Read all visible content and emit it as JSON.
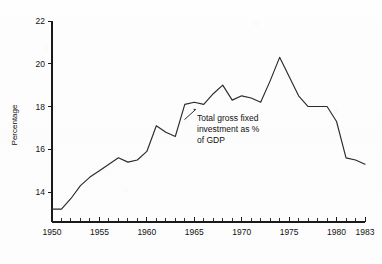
{
  "chart_data": {
    "type": "line",
    "title": "",
    "xlabel": "",
    "ylabel": "Percentage",
    "xlim": [
      1950,
      1983
    ],
    "ylim": [
      12.6,
      22
    ],
    "grid": false,
    "legend_position": "none",
    "x_ticks_major": [
      1950,
      1955,
      1960,
      1965,
      1970,
      1975,
      1980,
      1983
    ],
    "x_tick_labels": [
      "1950",
      "1955",
      "1960",
      "1965",
      "1970",
      "1975",
      "1980",
      "1983"
    ],
    "x_ticks_minor": [
      1951,
      1952,
      1953,
      1954,
      1956,
      1957,
      1958,
      1959,
      1961,
      1962,
      1963,
      1964,
      1966,
      1967,
      1968,
      1969,
      1971,
      1972,
      1973,
      1974,
      1976,
      1977,
      1978,
      1979,
      1981,
      1982
    ],
    "y_ticks": [
      14,
      16,
      18,
      20,
      22
    ],
    "y_tick_labels": [
      "14",
      "16",
      "18",
      "20",
      "22"
    ],
    "series": [
      {
        "name": "Total gross fixed investment as % of GDP",
        "x": [
          1950,
          1951,
          1952,
          1953,
          1954,
          1955,
          1956,
          1957,
          1958,
          1959,
          1960,
          1961,
          1962,
          1963,
          1964,
          1965,
          1966,
          1967,
          1968,
          1969,
          1970,
          1971,
          1972,
          1973,
          1974,
          1975,
          1976,
          1977,
          1978,
          1979,
          1980,
          1981,
          1982,
          1983
        ],
        "values": [
          13.2,
          13.2,
          13.7,
          14.3,
          14.7,
          15.0,
          15.3,
          15.6,
          15.4,
          15.5,
          15.9,
          17.1,
          16.8,
          16.6,
          18.1,
          18.2,
          18.1,
          18.6,
          19.0,
          18.3,
          18.5,
          18.4,
          18.2,
          19.2,
          20.3,
          19.4,
          18.5,
          18.0,
          18.0,
          18.0,
          17.3,
          15.6,
          15.5,
          15.3
        ]
      }
    ],
    "annotations": [
      {
        "text_lines": [
          "Total gross fixed",
          "investment as %",
          "of GDP"
        ],
        "points_to_year": 1964,
        "points_to_value": 17.4
      }
    ]
  },
  "axes": {
    "y_axis_title": "Percentage"
  }
}
